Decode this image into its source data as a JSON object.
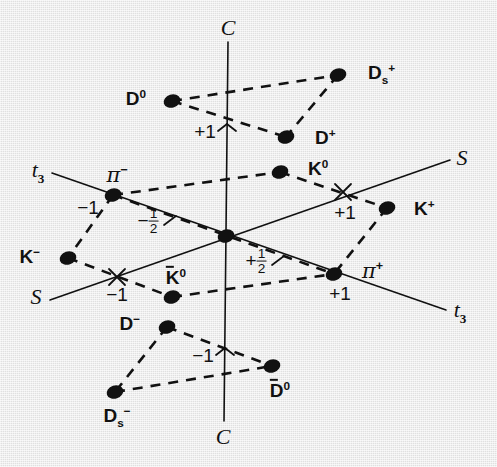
{
  "figure": {
    "background_color": "#e9e9e9",
    "ink_color": "#111111",
    "width": 497,
    "height": 467
  },
  "chart_data": {
    "type": "scatter",
    "xlabel": "t3",
    "ylabel": "S",
    "zlabel": "C",
    "grid": false,
    "legend": "none",
    "axes": [
      {
        "name": "C",
        "label": "C",
        "orientation": "vertical",
        "label_top": "C",
        "label_bottom": "C",
        "ticks": [
          {
            "value": "+1",
            "label": "+1"
          },
          {
            "value": "-1",
            "label": "−1"
          }
        ]
      },
      {
        "name": "t3",
        "label": "t3",
        "orientation": "diagonal-down-right",
        "label_left": "t3",
        "label_right": "t3",
        "ticks": [
          {
            "value": "-1",
            "label": "−1"
          },
          {
            "value": "-1/2",
            "label": "−½"
          },
          {
            "value": "+1/2",
            "label": "+½"
          },
          {
            "value": "+1",
            "label": "+1"
          }
        ]
      },
      {
        "name": "S",
        "label": "S",
        "orientation": "diagonal-up-right",
        "label_left": "S",
        "label_right": "S",
        "ticks": [
          {
            "value": "-1",
            "label": "−1"
          },
          {
            "value": "+1",
            "label": "+1"
          }
        ]
      }
    ],
    "points": [
      {
        "id": "D0",
        "label": "D",
        "sup": "0",
        "sub": "",
        "overbar": false,
        "x": 172,
        "y": 101,
        "label_x": 146,
        "label_y": 98,
        "label_anchor": "right",
        "layer": "charm-top"
      },
      {
        "id": "Ds+",
        "label": "D",
        "sup": "+",
        "sub": "s",
        "overbar": false,
        "x": 338,
        "y": 75,
        "label_x": 368,
        "label_y": 74,
        "label_anchor": "left",
        "layer": "charm-top"
      },
      {
        "id": "D+",
        "label": "D",
        "sup": "+",
        "sub": "",
        "overbar": false,
        "x": 286,
        "y": 137,
        "label_x": 315,
        "label_y": 137,
        "label_anchor": "left",
        "layer": "charm-top"
      },
      {
        "id": "K0",
        "label": "K",
        "sup": "0",
        "sub": "",
        "overbar": false,
        "x": 280,
        "y": 172,
        "label_x": 308,
        "label_y": 168,
        "label_anchor": "left",
        "layer": "middle"
      },
      {
        "id": "pi-",
        "label": "π",
        "sup": "−",
        "sub": "",
        "overbar": false,
        "x": 113,
        "y": 195,
        "label_x": 117,
        "label_y": 175,
        "label_anchor": "center",
        "layer": "middle"
      },
      {
        "id": "K-",
        "label": "K",
        "sup": "−",
        "sub": "",
        "overbar": false,
        "x": 68,
        "y": 258,
        "label_x": 40,
        "label_y": 256,
        "label_anchor": "right",
        "layer": "middle"
      },
      {
        "id": "K+",
        "label": "K",
        "sup": "+",
        "sub": "",
        "overbar": false,
        "x": 387,
        "y": 208,
        "label_x": 414,
        "label_y": 208,
        "label_anchor": "left",
        "layer": "middle"
      },
      {
        "id": "origin",
        "label": "",
        "sup": "",
        "sub": "",
        "overbar": false,
        "x": 226,
        "y": 236,
        "label_x": 0,
        "label_y": 0,
        "label_anchor": "none",
        "layer": "middle"
      },
      {
        "id": "K0bar",
        "label": "K",
        "sup": "0",
        "sub": "",
        "overbar": true,
        "x": 172,
        "y": 297,
        "label_x": 176,
        "label_y": 277,
        "label_anchor": "center",
        "layer": "middle"
      },
      {
        "id": "pi+",
        "label": "π",
        "sup": "+",
        "sub": "",
        "overbar": false,
        "x": 334,
        "y": 274,
        "label_x": 362,
        "label_y": 271,
        "label_anchor": "left",
        "layer": "middle"
      },
      {
        "id": "D-",
        "label": "D",
        "sup": "−",
        "sub": "",
        "overbar": false,
        "x": 167,
        "y": 327,
        "label_x": 140,
        "label_y": 323,
        "label_anchor": "right",
        "layer": "charm-bottom"
      },
      {
        "id": "D0bar",
        "label": "D",
        "sup": "0",
        "sub": "",
        "overbar": true,
        "x": 272,
        "y": 366,
        "label_x": 280,
        "label_y": 390,
        "label_anchor": "center",
        "layer": "charm-bottom"
      },
      {
        "id": "Ds-",
        "label": "D",
        "sup": "−",
        "sub": "s",
        "overbar": false,
        "x": 115,
        "y": 392,
        "label_x": 117,
        "label_y": 417,
        "label_anchor": "center",
        "layer": "charm-bottom"
      }
    ],
    "tick_annotations": [
      {
        "id": "c-plus-1",
        "text": "+1",
        "x": 205,
        "y": 131,
        "axis": "C"
      },
      {
        "id": "c-minus-1",
        "text": "−1",
        "x": 203,
        "y": 355,
        "axis": "C"
      },
      {
        "id": "t3-minus-1",
        "text": "−1",
        "x": 88,
        "y": 207,
        "axis": "t3"
      },
      {
        "id": "t3-plus-1",
        "text": "+1",
        "x": 340,
        "y": 293,
        "axis": "t3"
      },
      {
        "id": "s-minus-1",
        "text": "−1",
        "x": 117,
        "y": 294,
        "axis": "S"
      },
      {
        "id": "s-plus-1",
        "text": "+1",
        "x": 345,
        "y": 212,
        "axis": "S"
      }
    ],
    "fraction_annotations": [
      {
        "id": "t3-minus-half",
        "sign": "−",
        "num": "1",
        "den": "2",
        "x": 148,
        "y": 222
      },
      {
        "id": "t3-plus-half",
        "sign": "+",
        "num": "1",
        "den": "2",
        "x": 256,
        "y": 262
      }
    ],
    "axis_endpoint_labels": [
      {
        "id": "c-top",
        "text": "C",
        "sub": "",
        "x": 228,
        "y": 28
      },
      {
        "id": "c-bottom",
        "text": "C",
        "sub": "",
        "x": 223,
        "y": 437
      },
      {
        "id": "t3-left",
        "text": "t",
        "sub": "3",
        "x": 38,
        "y": 172
      },
      {
        "id": "t3-right",
        "text": "t",
        "sub": "3",
        "x": 460,
        "y": 312
      },
      {
        "id": "s-left",
        "text": "S",
        "sub": "",
        "x": 36,
        "y": 297
      },
      {
        "id": "s-right",
        "text": "S",
        "sub": "",
        "x": 462,
        "y": 158
      }
    ],
    "dashed_connections": [
      [
        "D0",
        "Ds+"
      ],
      [
        "D0",
        "D+"
      ],
      [
        "Ds+",
        "D+"
      ],
      [
        "pi-",
        "K0"
      ],
      [
        "pi-",
        "K-"
      ],
      [
        "K0",
        "K+"
      ],
      [
        "K-",
        "K0bar"
      ],
      [
        "K+",
        "pi+"
      ],
      [
        "K0bar",
        "pi+"
      ],
      [
        "pi-",
        "pi+"
      ],
      [
        "D-",
        "D0bar"
      ],
      [
        "D-",
        "Ds-"
      ],
      [
        "Ds-",
        "D0bar"
      ]
    ],
    "solid_axis_lines": [
      {
        "name": "C-axis",
        "x1": 228,
        "y1": 42,
        "x2": 224,
        "y2": 421
      },
      {
        "name": "t3-axis",
        "x1": 52,
        "y1": 173,
        "x2": 446,
        "y2": 310
      },
      {
        "name": "S-axis",
        "x1": 50,
        "y1": 300,
        "x2": 450,
        "y2": 160
      }
    ],
    "tick_crosses": [
      {
        "name": "s-minus-1-cross",
        "x": 117,
        "y": 277
      },
      {
        "name": "s-plus-1-cross",
        "x": 343,
        "y": 192
      },
      {
        "name": "c-plus-1-tick",
        "x": 227,
        "y": 124
      },
      {
        "name": "c-minus-1-tick",
        "x": 225,
        "y": 348
      }
    ]
  }
}
